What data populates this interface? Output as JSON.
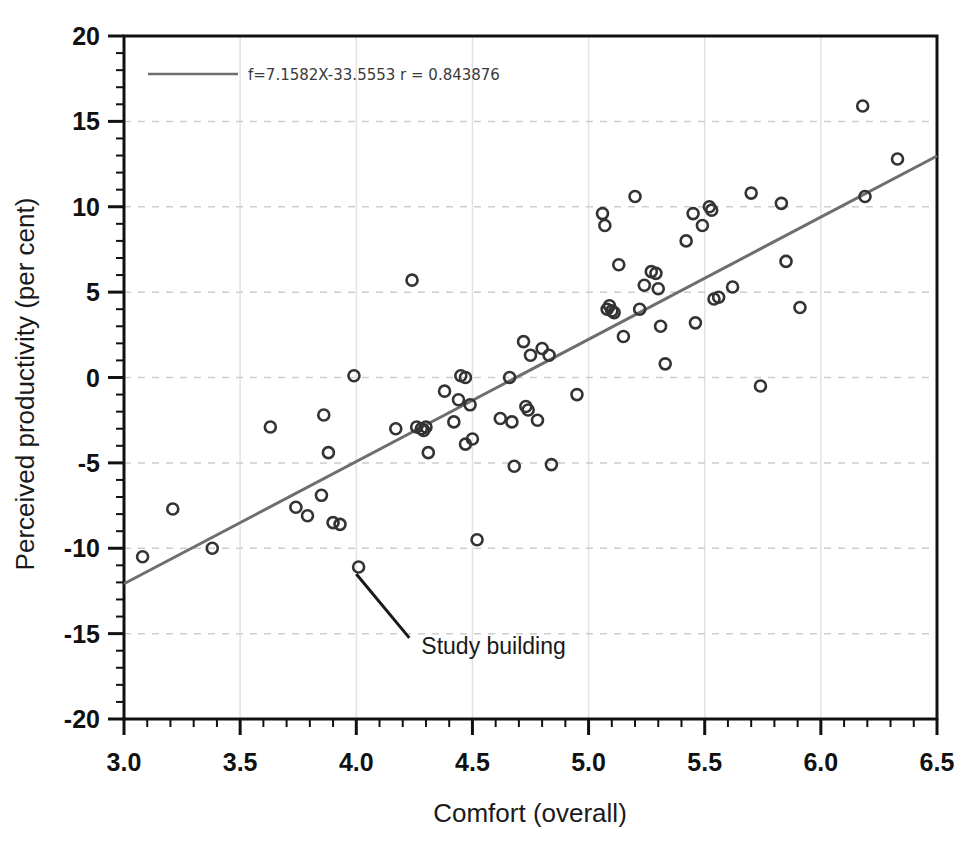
{
  "chart_data": {
    "type": "scatter",
    "title": "",
    "xlabel": "Comfort (overall)",
    "ylabel": "Perceived productivity (per cent)",
    "xlim": [
      3.0,
      6.5
    ],
    "ylim": [
      -20,
      20
    ],
    "xticks": [
      "3.0",
      "3.5",
      "4.0",
      "4.5",
      "5.0",
      "5.5",
      "6.0",
      "6.5"
    ],
    "xtick_values": [
      3.0,
      3.5,
      4.0,
      4.5,
      5.0,
      5.5,
      6.0,
      6.5
    ],
    "yticks": [
      "20",
      "15",
      "10",
      "5",
      "0",
      "-5",
      "-10",
      "-15",
      "-20"
    ],
    "ytick_values": [
      20,
      15,
      10,
      5,
      0,
      -5,
      -10,
      -15,
      -20
    ],
    "minor_ticks_per_interval": 5,
    "grid": "dashed horizontal gridlines and faint vertical gridlines",
    "legend_position": "top-left inside axes",
    "legend_entries": [
      {
        "label": "f=7.1582X-33.5553 r = 0.843876",
        "marker": "line",
        "color": "#6e6e6e"
      }
    ],
    "fit_line": {
      "slope": 7.1582,
      "intercept": -33.5553,
      "r": 0.843876,
      "equation": "f=7.1582X-33.5553 r = 0.843876",
      "color": "#6e6e6e",
      "x_start": 3.0,
      "x_end": 6.5,
      "y_start": -12.08,
      "y_end": 13.0
    },
    "annotations": [
      {
        "text": "Study building",
        "point_x": 4.0,
        "point_y": -11.1,
        "text_x": 4.28,
        "text_y": -15.6,
        "leader_line": true
      }
    ],
    "marker_style": {
      "shape": "open-circle",
      "edge_color": "#333333",
      "fill": "none",
      "size": 11
    },
    "series": [
      {
        "name": "Buildings",
        "points": [
          [
            3.08,
            -10.5
          ],
          [
            3.21,
            -7.7
          ],
          [
            3.38,
            -10.0
          ],
          [
            3.63,
            -2.9
          ],
          [
            3.74,
            -7.6
          ],
          [
            3.79,
            -8.1
          ],
          [
            3.86,
            -2.2
          ],
          [
            3.85,
            -6.9
          ],
          [
            3.88,
            -4.4
          ],
          [
            3.9,
            -8.5
          ],
          [
            3.93,
            -8.6
          ],
          [
            3.99,
            0.1
          ],
          [
            4.01,
            -11.1
          ],
          [
            4.17,
            -3.0
          ],
          [
            4.24,
            5.7
          ],
          [
            4.26,
            -2.9
          ],
          [
            4.28,
            -3.0
          ],
          [
            4.29,
            -3.1
          ],
          [
            4.3,
            -2.9
          ],
          [
            4.31,
            -4.4
          ],
          [
            4.38,
            -0.8
          ],
          [
            4.42,
            -2.6
          ],
          [
            4.45,
            0.1
          ],
          [
            4.44,
            -1.3
          ],
          [
            4.47,
            0.0
          ],
          [
            4.49,
            -1.6
          ],
          [
            4.47,
            -3.9
          ],
          [
            4.5,
            -3.6
          ],
          [
            4.52,
            -9.5
          ],
          [
            4.62,
            -2.4
          ],
          [
            4.66,
            0.0
          ],
          [
            4.67,
            -2.6
          ],
          [
            4.68,
            -5.2
          ],
          [
            4.72,
            2.1
          ],
          [
            4.73,
            -1.7
          ],
          [
            4.74,
            -1.9
          ],
          [
            4.75,
            1.3
          ],
          [
            4.78,
            -2.5
          ],
          [
            4.8,
            1.7
          ],
          [
            4.83,
            1.3
          ],
          [
            4.84,
            -5.1
          ],
          [
            4.95,
            -1.0
          ],
          [
            5.06,
            9.6
          ],
          [
            5.07,
            8.9
          ],
          [
            5.08,
            4.0
          ],
          [
            5.09,
            4.2
          ],
          [
            5.1,
            3.9
          ],
          [
            5.11,
            3.8
          ],
          [
            5.13,
            6.6
          ],
          [
            5.15,
            2.4
          ],
          [
            5.2,
            10.6
          ],
          [
            5.22,
            4.0
          ],
          [
            5.24,
            5.4
          ],
          [
            5.27,
            6.2
          ],
          [
            5.29,
            6.1
          ],
          [
            5.3,
            5.2
          ],
          [
            5.31,
            3.0
          ],
          [
            5.33,
            0.8
          ],
          [
            5.42,
            8.0
          ],
          [
            5.45,
            9.6
          ],
          [
            5.46,
            3.2
          ],
          [
            5.49,
            8.9
          ],
          [
            5.52,
            10.0
          ],
          [
            5.53,
            9.8
          ],
          [
            5.54,
            4.6
          ],
          [
            5.56,
            4.7
          ],
          [
            5.62,
            5.3
          ],
          [
            5.7,
            10.8
          ],
          [
            5.74,
            -0.5
          ],
          [
            5.83,
            10.2
          ],
          [
            5.85,
            6.8
          ],
          [
            5.91,
            4.1
          ],
          [
            6.18,
            15.9
          ],
          [
            6.19,
            10.6
          ],
          [
            6.33,
            12.8
          ]
        ]
      }
    ]
  }
}
